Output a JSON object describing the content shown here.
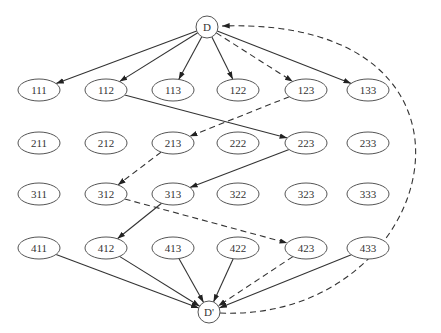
{
  "diagram": {
    "type": "directed-graph",
    "source_node": {
      "id": "D",
      "label": "D",
      "x": 207,
      "y": 27
    },
    "sink_node": {
      "id": "Dp",
      "label": "D'",
      "x": 209,
      "y": 312
    },
    "columns_x": [
      39,
      106,
      173,
      238,
      306,
      368
    ],
    "rows_y": [
      90,
      143,
      194,
      248
    ],
    "rows": [
      [
        "111",
        "112",
        "113",
        "122",
        "123",
        "133"
      ],
      [
        "211",
        "212",
        "213",
        "222",
        "223",
        "233"
      ],
      [
        "311",
        "312",
        "313",
        "322",
        "323",
        "333"
      ],
      [
        "411",
        "412",
        "413",
        "422",
        "423",
        "433"
      ]
    ],
    "edges": [
      {
        "from": "D",
        "to": "111",
        "style": "solid"
      },
      {
        "from": "D",
        "to": "112",
        "style": "solid"
      },
      {
        "from": "D",
        "to": "113",
        "style": "solid"
      },
      {
        "from": "D",
        "to": "122",
        "style": "solid"
      },
      {
        "from": "D",
        "to": "123",
        "style": "dashed"
      },
      {
        "from": "D",
        "to": "133",
        "style": "solid"
      },
      {
        "from": "112",
        "to": "223",
        "style": "solid"
      },
      {
        "from": "123",
        "to": "213",
        "style": "dashed"
      },
      {
        "from": "223",
        "to": "313",
        "style": "solid"
      },
      {
        "from": "213",
        "to": "312",
        "style": "dashed"
      },
      {
        "from": "313",
        "to": "412",
        "style": "solid"
      },
      {
        "from": "312",
        "to": "423",
        "style": "dashed"
      },
      {
        "from": "411",
        "to": "D'",
        "style": "solid"
      },
      {
        "from": "412",
        "to": "D'",
        "style": "solid"
      },
      {
        "from": "413",
        "to": "D'",
        "style": "solid"
      },
      {
        "from": "422",
        "to": "D'",
        "style": "solid"
      },
      {
        "from": "423",
        "to": "D'",
        "style": "dashed"
      },
      {
        "from": "433",
        "to": "D'",
        "style": "solid"
      },
      {
        "from": "D'",
        "to": "D",
        "style": "dashed",
        "curved": true
      }
    ]
  }
}
